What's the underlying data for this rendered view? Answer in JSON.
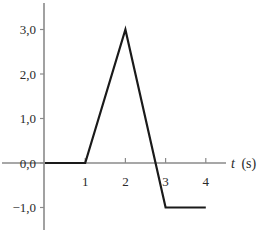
{
  "chart_data": {
    "type": "line",
    "title": "",
    "xlabel": "t (s)",
    "xlabel_var": "t",
    "xlabel_unit": "(s)",
    "ylabel": "",
    "x": [
      0,
      1,
      2,
      3,
      4
    ],
    "series": [
      {
        "name": "signal",
        "values": [
          0.0,
          0.0,
          3.0,
          -1.0,
          -1.0
        ]
      }
    ],
    "x_ticks": [
      1,
      2,
      3,
      4
    ],
    "x_tick_labels": [
      "1",
      "2",
      "3",
      "4"
    ],
    "y_ticks": [
      3.0,
      2.0,
      1.0,
      0.0,
      -1.0
    ],
    "y_tick_labels": [
      "3,0",
      "2,0",
      "1,0",
      "0,0",
      "−1,0"
    ],
    "xlim": [
      0,
      4.5
    ],
    "ylim": [
      -1.5,
      3.6
    ],
    "grid": false,
    "legend": "none",
    "line_color": "#1a1a1a",
    "axis_color": "#8a8a8a"
  }
}
